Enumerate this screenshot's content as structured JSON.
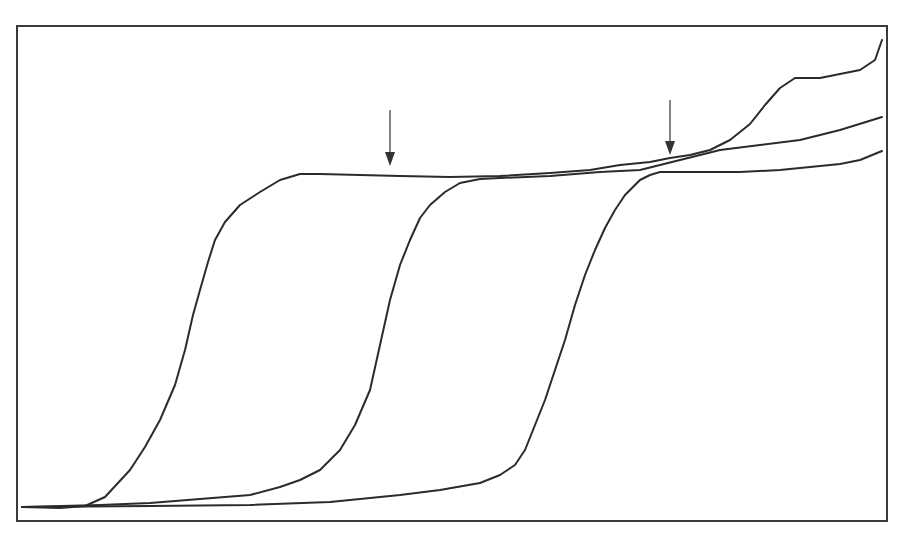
{
  "chart_data": {
    "type": "line",
    "title": "",
    "xlabel": "",
    "ylabel": "",
    "grid": false,
    "legend": null,
    "axis_ticks_visible": false,
    "note": "No axis labels, ticks or legend are shown; values are normalized (x: 0-100 across plot width, y: 0-100 from bottom to top of plot frame).",
    "xlim": [
      0,
      100
    ],
    "ylim": [
      0,
      100
    ],
    "series": [
      {
        "name": "curve-1",
        "points": [
          [
            0,
            3
          ],
          [
            7,
            3
          ],
          [
            13,
            9
          ],
          [
            16,
            17
          ],
          [
            19,
            31
          ],
          [
            21,
            45
          ],
          [
            23,
            57
          ],
          [
            25,
            66
          ],
          [
            28,
            72
          ],
          [
            32,
            74
          ],
          [
            37,
            74
          ],
          [
            45,
            74
          ],
          [
            55,
            73
          ],
          [
            65,
            72
          ],
          [
            70,
            72
          ],
          [
            75,
            71
          ],
          [
            79,
            69
          ],
          [
            83,
            61
          ],
          [
            87,
            57
          ],
          [
            89,
            54
          ],
          [
            92,
            54
          ],
          [
            94,
            52
          ],
          [
            96,
            50
          ],
          [
            100,
            97
          ]
        ]
      },
      {
        "name": "curve-2",
        "points": [
          [
            0,
            3
          ],
          [
            15,
            4
          ],
          [
            26,
            6
          ],
          [
            32,
            9
          ],
          [
            36,
            15
          ],
          [
            39,
            24
          ],
          [
            41,
            36
          ],
          [
            43,
            50
          ],
          [
            46,
            60
          ],
          [
            48,
            67
          ],
          [
            51,
            71
          ],
          [
            55,
            72
          ],
          [
            62,
            72
          ],
          [
            70,
            73
          ],
          [
            77,
            73
          ],
          [
            83,
            77
          ],
          [
            88,
            79
          ],
          [
            94,
            80
          ],
          [
            100,
            82
          ]
        ]
      },
      {
        "name": "curve-3",
        "points": [
          [
            0,
            3
          ],
          [
            26,
            3
          ],
          [
            43,
            5
          ],
          [
            52,
            8
          ],
          [
            57,
            13
          ],
          [
            60,
            24
          ],
          [
            63,
            38
          ],
          [
            66,
            54
          ],
          [
            68,
            62
          ],
          [
            71,
            68
          ],
          [
            73,
            70
          ],
          [
            80,
            71
          ],
          [
            88,
            72
          ],
          [
            94,
            73
          ],
          [
            100,
            75
          ]
        ]
      }
    ],
    "annotations": [
      {
        "type": "arrow",
        "direction": "down",
        "x": 42,
        "y": 73,
        "label": ""
      },
      {
        "type": "arrow",
        "direction": "down",
        "x": 75,
        "y": 74,
        "label": ""
      }
    ]
  },
  "render": {
    "frame": {
      "x": 17,
      "y": 26,
      "width": 870,
      "height": 495
    },
    "colors": {
      "line": "#2b2b2b",
      "frame": "#3a3a3a",
      "arrow": "#333333",
      "background": "#ffffff"
    },
    "curves_px": [
      {
        "name": "curve-1",
        "points": "22,507 60,508 85,506 105,497 130,470 145,447 160,420 175,385 185,350 193,315 200,290 208,262 215,240 225,222 240,205 260,192 280,180 300,174 320,174 360,175 400,176 450,177 500,176 550,173 590,170 620,165 650,162 670,158 690,155 710,150 730,140 750,124 765,105 780,88 795,78 820,78 840,74 860,70 875,60 882,40"
      },
      {
        "name": "curve-2",
        "points": "22,507 100,505 150,503 200,499 250,495 280,487 300,480 320,470 340,450 355,425 370,390 380,345 390,300 400,265 410,240 420,218 430,205 445,192 460,183 480,179 500,178 550,176 600,172 640,170 680,160 720,150 760,145 800,140 840,130 882,117"
      },
      {
        "name": "curve-3",
        "points": "22,507 150,506 250,505 330,502 400,495 440,490 480,483 500,475 515,465 525,450 535,425 545,400 555,370 565,340 575,305 585,275 595,250 605,228 615,210 625,195 640,180 650,175 660,172 700,172 740,172 780,170 800,168 840,164 860,160 882,151"
      }
    ],
    "arrows_px": [
      {
        "name": "arrow-1",
        "x": 390,
        "y1": 110,
        "y2": 166
      },
      {
        "name": "arrow-2",
        "x": 670,
        "y1": 100,
        "y2": 155
      }
    ]
  }
}
